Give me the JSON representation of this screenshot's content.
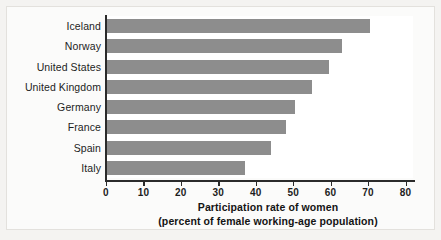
{
  "chart_data": {
    "type": "bar",
    "orientation": "horizontal",
    "title": "",
    "xlabel_line1": "Participation rate of women",
    "xlabel_line2": "(percent of female working-age population)",
    "ylabel": "",
    "categories": [
      "Iceland",
      "Norway",
      "United States",
      "United Kingdom",
      "Germany",
      "France",
      "Spain",
      "Italy"
    ],
    "values": [
      70.5,
      63,
      59.5,
      55,
      50.5,
      48,
      44,
      37
    ],
    "xlim": [
      0,
      82
    ],
    "xticks": [
      0,
      10,
      20,
      30,
      40,
      50,
      60,
      70,
      80
    ],
    "xtick_labels": [
      "0",
      "10",
      "20",
      "30",
      "40",
      "50",
      "60",
      "70",
      "80"
    ],
    "grid": false,
    "legend": null,
    "bar_color": "#8d8d8d",
    "axis_color": "#2b2b2b",
    "background_color": "#ffffff"
  }
}
